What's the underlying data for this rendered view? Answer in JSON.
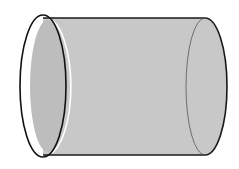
{
  "diagram": {
    "description": "Cylinder drawn horizontally with an open left end",
    "colors": {
      "background": "#ffffff",
      "body_fill": "#c9c9c9",
      "inner_fill": "#bcbcbc",
      "outline": "#1a1a1a",
      "highlight": "#ffffff"
    },
    "shapes": {
      "left_rim": {
        "cx": 43,
        "cy": 86,
        "rx": 23,
        "ry": 71
      },
      "body": {
        "left_x": 43,
        "right_x": 205,
        "top_y": 18,
        "bottom_y": 155
      },
      "right_end": {
        "cx": 205,
        "cy": 86.5,
        "rx": 22,
        "ry": 68.5
      },
      "right_inner_line": {
        "cx": 205,
        "cy": 86.5,
        "rx": 19,
        "ry": 68.5
      }
    }
  }
}
